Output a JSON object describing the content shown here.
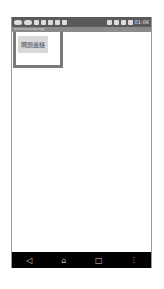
{
  "status_bar": {
    "time": "01:06",
    "icons": [
      "message-icon",
      "cast-icon",
      "location-icon",
      "facebook-icon",
      "settings-icon",
      "download-icon",
      "image-icon",
      "nfc-icon",
      "wifi-icon",
      "signal-icon",
      "battery-icon"
    ]
  },
  "title_bar": {
    "text": "Antichronsmdiscopp"
  },
  "main": {
    "report_button_label": "問題連絡"
  },
  "nav_bar": {
    "back": "◁",
    "home": "⌂",
    "recents": "□",
    "menu": "⋮"
  }
}
